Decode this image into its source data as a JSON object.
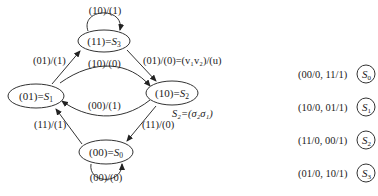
{
  "diagram": {
    "type": "state-transition",
    "states": [
      {
        "id": "S3",
        "code": "(11)=",
        "name": "S",
        "sub": "3"
      },
      {
        "id": "S1",
        "code": "(01)=",
        "name": "S",
        "sub": "1"
      },
      {
        "id": "S2",
        "code": "(10)=",
        "name": "S",
        "sub": "2"
      },
      {
        "id": "S0",
        "code": "(00)=",
        "name": "S",
        "sub": "0"
      }
    ],
    "transitions": [
      {
        "from": "S3",
        "to": "S3",
        "label": "(10)/(1)"
      },
      {
        "from": "S1",
        "to": "S3",
        "label": "(01)/(1)"
      },
      {
        "from": "S1",
        "to": "S2",
        "label": "(10)/(0)"
      },
      {
        "from": "S3",
        "to": "S2",
        "label": "(01)/(0)=(v₁v₂)/(u)"
      },
      {
        "from": "S2",
        "to": "S1",
        "label": "(00)/(1)"
      },
      {
        "from": "S0",
        "to": "S1",
        "label": "(11)/(1)"
      },
      {
        "from": "S2",
        "to": "S0",
        "label": "(11)/(0)"
      },
      {
        "from": "S0",
        "to": "S0",
        "label": "(00)/(0)"
      }
    ],
    "annotation": "S₂=(σ₂σ₁)",
    "legend": [
      {
        "text": "(00/0, 11/1)",
        "state": "S",
        "sub": "0"
      },
      {
        "text": "(10/0, 01/1)",
        "state": "S",
        "sub": "1"
      },
      {
        "text": "(11/0, 00/1)",
        "state": "S",
        "sub": "2"
      },
      {
        "text": "(01/0, 10/1)",
        "state": "S",
        "sub": "3"
      }
    ]
  }
}
